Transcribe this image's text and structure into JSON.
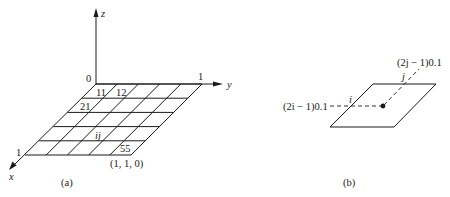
{
  "panel_a": {
    "caption": "(a)",
    "axes": {
      "z_label": "z",
      "y_label": "y",
      "x_label": "x",
      "origin_label": "0",
      "y_tick_label": "1",
      "x_tick_label": "1"
    },
    "grid": {
      "rows": 5,
      "cols": 5,
      "cell_labels": {
        "c11": "11",
        "c12": "12",
        "c21": "21",
        "cij": "ij",
        "c55": "55"
      },
      "corner_label": "(1, 1, 0)"
    }
  },
  "panel_b": {
    "caption": "(b)",
    "i_label": "i",
    "j_label": "j",
    "i_coord_label": "(2i − 1)0.1",
    "j_coord_label": "(2j − 1)0.1"
  }
}
